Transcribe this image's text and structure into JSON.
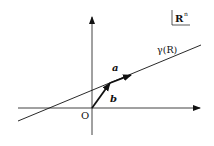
{
  "diagram": {
    "space_label": "R",
    "space_superscript": "n",
    "curve_label": "γ(R)",
    "vector_a_label": "a",
    "vector_b_label": "b",
    "origin_label": "O",
    "colors": {
      "stroke": "#111111",
      "background": "#ffffff"
    }
  }
}
